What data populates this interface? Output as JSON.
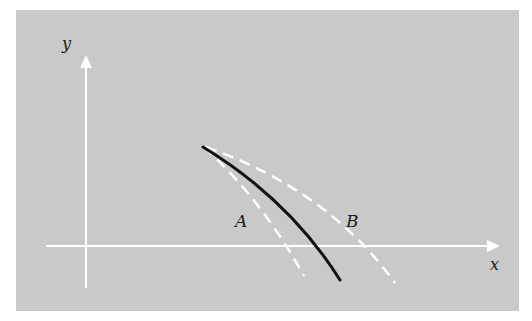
{
  "diagram": {
    "background_color": "#c9c9c9",
    "axis_color": "#ffffff",
    "axes": {
      "x_label": "x",
      "y_label": "y"
    },
    "curves": [
      {
        "id": "actual",
        "style": "solid",
        "color": "#111111",
        "label": ""
      },
      {
        "id": "A",
        "style": "dashed",
        "color": "#ffffff",
        "label": "A"
      },
      {
        "id": "B",
        "style": "dashed",
        "color": "#ffffff",
        "label": "B"
      }
    ]
  }
}
